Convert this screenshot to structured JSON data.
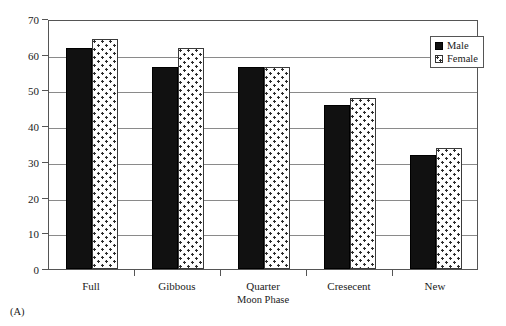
{
  "panel_label": "(A)",
  "legend": {
    "position": "top-right",
    "entries": [
      {
        "label": "Male",
        "pattern": "solid-black",
        "color": "#111111"
      },
      {
        "label": "Female",
        "pattern": "dotted-white",
        "color": "#ffffff"
      }
    ]
  },
  "chart_data": {
    "type": "bar",
    "title": "",
    "subtitle": "",
    "xlabel": "Moon Phase",
    "ylabel": "% Time Spent Foraging",
    "categories": [
      "Full",
      "Gibbous",
      "Quarter",
      "Cresecent",
      "New"
    ],
    "series": [
      {
        "name": "Male",
        "values": [
          62,
          56.5,
          56.5,
          46,
          32
        ]
      },
      {
        "name": "Female",
        "values": [
          64.5,
          62,
          56.5,
          48,
          34
        ]
      }
    ],
    "ylim": [
      0,
      70
    ],
    "ytick_values": [
      0,
      10,
      20,
      30,
      40,
      50,
      60,
      70
    ],
    "ytick_labels": [
      "0",
      "10",
      "20",
      "30",
      "40",
      "50",
      "60",
      "70"
    ],
    "grid": "horizontal",
    "legend_position": "top-right",
    "annotations": [
      "(A)"
    ]
  }
}
